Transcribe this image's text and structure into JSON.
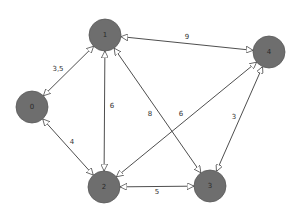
{
  "diagram": {
    "type": "weighted-graph",
    "nodes": [
      {
        "id": "1",
        "label": "1",
        "x": 105,
        "y": 35
      },
      {
        "id": "4",
        "label": "4",
        "x": 269,
        "y": 52
      },
      {
        "id": "0",
        "label": "0",
        "x": 32,
        "y": 107
      },
      {
        "id": "2",
        "label": "2",
        "x": 104,
        "y": 187
      },
      {
        "id": "3",
        "label": "3",
        "x": 210,
        "y": 186
      }
    ],
    "edges": [
      {
        "from": "0",
        "to": "1",
        "label": "3,5",
        "bidirectional": true,
        "lx": 58,
        "ly": 69
      },
      {
        "from": "1",
        "to": "4",
        "label": "9",
        "bidirectional": true,
        "lx": 187,
        "ly": 37
      },
      {
        "from": "1",
        "to": "2",
        "label": "6",
        "bidirectional": true,
        "lx": 112,
        "ly": 106
      },
      {
        "from": "1",
        "to": "3",
        "label": "8",
        "bidirectional": true,
        "lx": 150,
        "ly": 114
      },
      {
        "from": "2",
        "to": "4",
        "label": "6",
        "bidirectional": true,
        "lx": 181,
        "ly": 114
      },
      {
        "from": "4",
        "to": "3",
        "label": "3",
        "bidirectional": true,
        "lx": 234,
        "ly": 117
      },
      {
        "from": "0",
        "to": "2",
        "label": "4",
        "bidirectional": true,
        "lx": 72,
        "ly": 142
      },
      {
        "from": "2",
        "to": "3",
        "label": "5",
        "bidirectional": true,
        "lx": 157,
        "ly": 192
      }
    ]
  },
  "colors": {
    "node_fill": "#6e6e6e",
    "edge": "#3a3a3a",
    "background": "#ffffff"
  }
}
